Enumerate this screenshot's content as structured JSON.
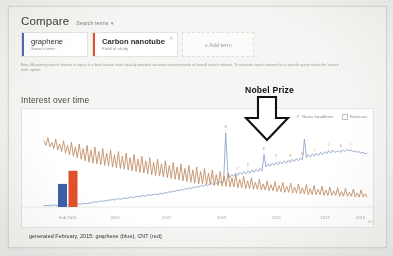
{
  "compare": {
    "title": "Compare",
    "subtitle": "Search terms",
    "caret_icon": "chevron-down-icon",
    "terms": [
      {
        "name": "graphene",
        "kind": "Search term",
        "color": "#4a6fb5",
        "remove_icon": "close-icon"
      },
      {
        "name": "Carbon nanotube",
        "kind": "Field of study",
        "color": "#e0502a",
        "remove_icon": "close-icon"
      }
    ],
    "add_term_label": "+ Add term"
  },
  "beta_note": "Beta: Measuring search interest in topics is a beta feature which quickly provides accurate measurements of overall search interest. To measure search interest for a specific query select the 'search term' option.",
  "section": {
    "interest_over_time_title": "Interest over time"
  },
  "chart_toggles": [
    {
      "label": "News headlines",
      "checked": true,
      "icon": "check-icon"
    },
    {
      "label": "Forecast",
      "checked": false,
      "icon": "checkbox-icon"
    }
  ],
  "annotation": {
    "label": "Nobel Prize",
    "arrow_icon": "arrow-down-icon"
  },
  "caption": "generated February, 2015: graphene (blue), CNT (red)",
  "corner_mark": "G/Y",
  "chart_data": {
    "type": "line",
    "title": "Interest over time",
    "xlabel": "",
    "ylabel": "Relative search interest",
    "ylim": [
      0,
      100
    ],
    "grid": false,
    "legend_position": "caption",
    "xtick_labels": [
      "2005",
      "2007",
      "2009",
      "2011",
      "2013",
      "2015"
    ],
    "xtick_positions_pct": [
      22,
      38,
      55,
      72,
      87,
      98
    ],
    "annotations": [
      {
        "text": "Nobel Prize",
        "x_pct": 62,
        "y_value": 96,
        "style": "block-arrow-down"
      }
    ],
    "inset_bars": {
      "type": "bar",
      "label": "Feb 2015",
      "categories": [
        "graphene",
        "CNT"
      ],
      "values": [
        30,
        47
      ],
      "colors": [
        "#3c5fa8",
        "#e0502a"
      ]
    },
    "series": [
      {
        "name": "graphene",
        "color": "#8aa2c8",
        "values": [
          2,
          2,
          2,
          2,
          2,
          3,
          2,
          2,
          3,
          2,
          3,
          3,
          3,
          3,
          3,
          3,
          4,
          4,
          4,
          4,
          5,
          4,
          5,
          5,
          6,
          7,
          6,
          7,
          8,
          7,
          8,
          8,
          9,
          9,
          10,
          9,
          10,
          11,
          10,
          11,
          12,
          11,
          12,
          13,
          12,
          13,
          14,
          13,
          14,
          15,
          14,
          15,
          16,
          15,
          16,
          17,
          16,
          17,
          18,
          17,
          19,
          18,
          20,
          19,
          21,
          20,
          22,
          21,
          23,
          22,
          24,
          23,
          25,
          24,
          26,
          25,
          27,
          26,
          28,
          27,
          29,
          28,
          30,
          31,
          29,
          32,
          30,
          33,
          31,
          34,
          96,
          46,
          38,
          42,
          40,
          44,
          41,
          45,
          42,
          46,
          43,
          47,
          44,
          48,
          45,
          49,
          46,
          50,
          47,
          68,
          52,
          56,
          53,
          57,
          54,
          58,
          55,
          59,
          56,
          60,
          57,
          61,
          58,
          62,
          59,
          63,
          60,
          64,
          61,
          88,
          64,
          68,
          65,
          69,
          66,
          70,
          67,
          71,
          68,
          72,
          69,
          73,
          70,
          74,
          71,
          72,
          73,
          71,
          74,
          72,
          75,
          73,
          74,
          72,
          73,
          71,
          72,
          70,
          71,
          69,
          70
        ]
      },
      {
        "name": "CNT",
        "color": "#c08a62",
        "values": [
          86,
          80,
          90,
          78,
          84,
          76,
          88,
          74,
          82,
          72,
          86,
          70,
          80,
          68,
          84,
          66,
          78,
          64,
          82,
          62,
          76,
          60,
          80,
          58,
          74,
          57,
          78,
          56,
          72,
          55,
          76,
          54,
          70,
          53,
          74,
          52,
          68,
          51,
          72,
          50,
          66,
          49,
          70,
          48,
          64,
          47,
          68,
          46,
          62,
          45,
          66,
          44,
          60,
          43,
          64,
          42,
          58,
          41,
          62,
          40,
          56,
          39,
          60,
          38,
          54,
          37,
          58,
          36,
          52,
          35,
          56,
          34,
          50,
          33,
          54,
          32,
          48,
          31,
          52,
          30,
          46,
          30,
          50,
          29,
          44,
          29,
          48,
          28,
          42,
          28,
          46,
          27,
          40,
          27,
          44,
          26,
          38,
          26,
          42,
          25,
          36,
          25,
          40,
          24,
          34,
          24,
          38,
          23,
          32,
          23,
          36,
          22,
          30,
          22,
          34,
          21,
          29,
          21,
          33,
          20,
          28,
          20,
          32,
          19,
          27,
          19,
          31,
          18,
          26,
          18,
          30,
          17,
          25,
          17,
          29,
          16,
          24,
          16,
          28,
          16,
          23,
          16,
          27,
          15,
          22,
          15,
          26,
          15,
          21,
          15,
          25,
          14,
          20,
          14,
          24,
          14,
          19,
          14,
          23,
          13,
          18,
          13,
          22,
          13,
          17,
          13
        ]
      }
    ],
    "news_markers": [
      {
        "label": "A",
        "x_pct": 52
      },
      {
        "label": "B",
        "x_pct": 56
      },
      {
        "label": "C",
        "x_pct": 60
      },
      {
        "label": "D",
        "x_pct": 63
      },
      {
        "label": "E",
        "x_pct": 68
      },
      {
        "label": "F",
        "x_pct": 72
      },
      {
        "label": "G",
        "x_pct": 76
      },
      {
        "label": "H",
        "x_pct": 80
      },
      {
        "label": "I",
        "x_pct": 84
      },
      {
        "label": "J",
        "x_pct": 88
      },
      {
        "label": "K",
        "x_pct": 92
      },
      {
        "label": "L",
        "x_pct": 95
      }
    ]
  }
}
